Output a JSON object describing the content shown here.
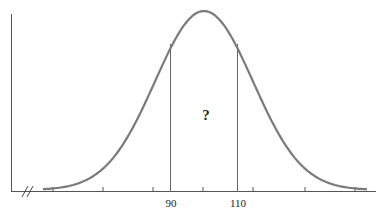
{
  "chart_data": {
    "type": "normal-curve",
    "title": "",
    "xlabel": "",
    "ylabel": "",
    "tick_labels": [
      "90",
      "110"
    ],
    "shaded_region": {
      "from": 90,
      "to": 110,
      "label": "?"
    },
    "axis_break": "//",
    "grid": false
  },
  "labels": {
    "left_bound": "90",
    "right_bound": "110",
    "region": "?"
  },
  "colors": {
    "curve": "#7a7a7a",
    "axis": "#555555",
    "bound_lines": "#666666"
  }
}
